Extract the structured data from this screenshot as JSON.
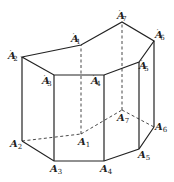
{
  "figure": {
    "vertices": {
      "A1": {
        "label": "A",
        "sub": "1",
        "prime": false,
        "x": 81,
        "y": 134
      },
      "A2": {
        "label": "A",
        "sub": "2",
        "prime": false,
        "x": 22,
        "y": 141
      },
      "A3": {
        "label": "A",
        "sub": "3",
        "prime": false,
        "x": 54,
        "y": 161
      },
      "A4": {
        "label": "A",
        "sub": "4",
        "prime": false,
        "x": 104,
        "y": 161
      },
      "A5": {
        "label": "A",
        "sub": "5",
        "prime": false,
        "x": 139,
        "y": 149
      },
      "A6": {
        "label": "A",
        "sub": "6",
        "prime": false,
        "x": 154,
        "y": 127
      },
      "A7": {
        "label": "A",
        "sub": "7",
        "prime": false,
        "x": 122,
        "y": 110
      },
      "A1p": {
        "label": "A",
        "sub": "1",
        "prime": true,
        "x": 81,
        "y": 45
      },
      "A2p": {
        "label": "A",
        "sub": "2",
        "prime": true,
        "x": 22,
        "y": 57
      },
      "A3p": {
        "label": "A",
        "sub": "3",
        "prime": true,
        "x": 54,
        "y": 75
      },
      "A4p": {
        "label": "A",
        "sub": "4",
        "prime": true,
        "x": 104,
        "y": 75
      },
      "A5p": {
        "label": "A",
        "sub": "5",
        "prime": true,
        "x": 139,
        "y": 62
      },
      "A6p": {
        "label": "A",
        "sub": "6",
        "prime": true,
        "x": 154,
        "y": 41
      },
      "A7p": {
        "label": "A",
        "sub": "7",
        "prime": true,
        "x": 122,
        "y": 22
      }
    },
    "labels": {
      "A1": "A1",
      "A2": "A2",
      "A3": "A3",
      "A4": "A4",
      "A5": "A5",
      "A6": "A6",
      "A7": "A7",
      "A1p": "A'1",
      "A2p": "A'2",
      "A3p": "A'3",
      "A4p": "A'4",
      "A5p": "A'5",
      "A6p": "A'6",
      "A7p": "A'7"
    },
    "edges_visible": [
      [
        "A2p",
        "A1p"
      ],
      [
        "A1p",
        "A7p"
      ],
      [
        "A7p",
        "A6p"
      ],
      [
        "A6p",
        "A5p"
      ],
      [
        "A5p",
        "A4p"
      ],
      [
        "A4p",
        "A3p"
      ],
      [
        "A3p",
        "A2p"
      ],
      [
        "A2",
        "A3"
      ],
      [
        "A3",
        "A4"
      ],
      [
        "A4",
        "A5"
      ],
      [
        "A5",
        "A6"
      ],
      [
        "A2",
        "A2p"
      ],
      [
        "A3",
        "A3p"
      ],
      [
        "A4",
        "A4p"
      ],
      [
        "A5",
        "A5p"
      ],
      [
        "A6",
        "A6p"
      ]
    ],
    "edges_hidden": [
      [
        "A2",
        "A1"
      ],
      [
        "A1",
        "A7"
      ],
      [
        "A7",
        "A6"
      ],
      [
        "A1",
        "A1p"
      ],
      [
        "A7",
        "A7p"
      ]
    ]
  }
}
